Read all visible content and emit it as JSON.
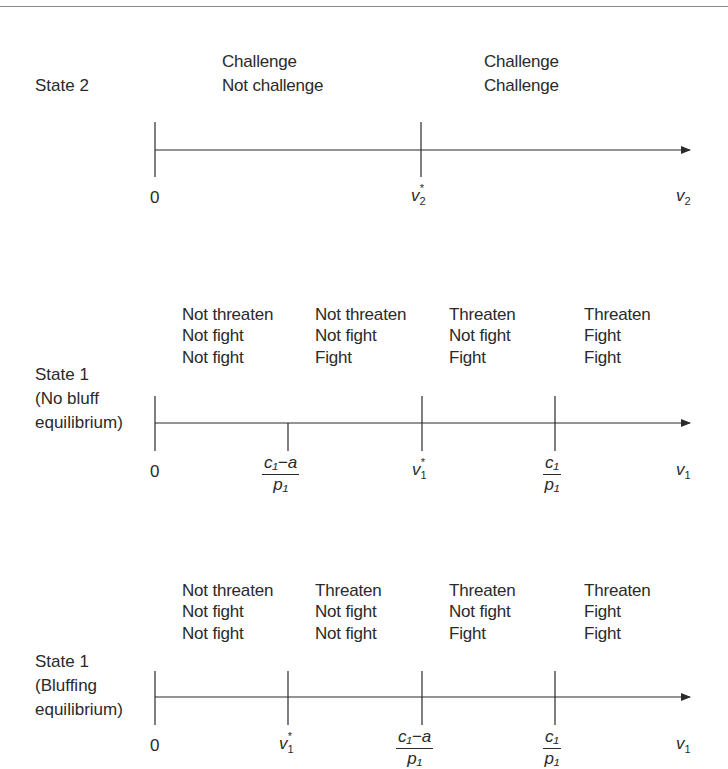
{
  "panels": [
    {
      "id": "state2",
      "label_lines": [
        "State 2"
      ],
      "columns": [
        {
          "lines": [
            "Challenge",
            "Not challenge"
          ]
        },
        {
          "lines": [
            "Challenge",
            "Challenge"
          ]
        }
      ],
      "ticks": [
        {
          "label": "0",
          "type": "plain"
        },
        {
          "label": "v",
          "sub": "2",
          "sup": "*",
          "type": "var"
        }
      ],
      "axis_label": {
        "main": "v",
        "sub": "2"
      }
    },
    {
      "id": "state1-no-bluff",
      "label_lines": [
        "State 1",
        "(No bluff",
        "equilibrium)"
      ],
      "columns": [
        {
          "lines": [
            "Not threaten",
            "Not fight",
            "Not fight"
          ]
        },
        {
          "lines": [
            "Not threaten",
            "Not fight",
            "Fight"
          ]
        },
        {
          "lines": [
            "Threaten",
            "Not fight",
            "Fight"
          ]
        },
        {
          "lines": [
            "Threaten",
            "Fight",
            "Fight"
          ]
        }
      ],
      "ticks": [
        {
          "label": "0",
          "type": "plain"
        },
        {
          "num": "c₁−a",
          "den": "p₁",
          "type": "fraction"
        },
        {
          "label": "v",
          "sub": "1",
          "sup": "*",
          "type": "var"
        },
        {
          "num": "c₁",
          "den": "p₁",
          "type": "fraction"
        }
      ],
      "axis_label": {
        "main": "v",
        "sub": "1"
      }
    },
    {
      "id": "state1-bluffing",
      "label_lines": [
        "State 1",
        "(Bluffing",
        "equilibrium)"
      ],
      "columns": [
        {
          "lines": [
            "Not threaten",
            "Not fight",
            "Not fight"
          ]
        },
        {
          "lines": [
            "Threaten",
            "Not fight",
            "Not fight"
          ]
        },
        {
          "lines": [
            "Threaten",
            "Not fight",
            "Fight"
          ]
        },
        {
          "lines": [
            "Threaten",
            "Fight",
            "Fight"
          ]
        }
      ],
      "ticks": [
        {
          "label": "0",
          "type": "plain"
        },
        {
          "label": "v",
          "sub": "1",
          "sup": "*",
          "type": "var"
        },
        {
          "num": "c₁−a",
          "den": "p₁",
          "type": "fraction"
        },
        {
          "num": "c₁",
          "den": "p₁",
          "type": "fraction"
        }
      ],
      "axis_label": {
        "main": "v",
        "sub": "1"
      }
    }
  ],
  "colors": {
    "line": "#2a2a2a",
    "text": "#2a2a2a",
    "rule": "#8a8a8a"
  }
}
